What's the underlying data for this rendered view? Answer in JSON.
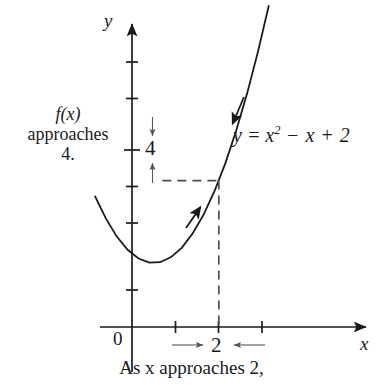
{
  "figure": {
    "title_caption": "As x approaches 2,",
    "background_color": "#ffffff",
    "ink_color": "#1a1a1a",
    "dash_color": "#6a6a6a"
  },
  "axes": {
    "y_label": "y",
    "x_label": "x",
    "origin_label": "0",
    "y_value_label": "4",
    "x_value_label": "2"
  },
  "annotations": {
    "left_line1": "f(x)",
    "left_line2": "approaches",
    "left_line3": "4.",
    "equation_lhs": "y = x",
    "equation_exp": "2",
    "equation_rhs": " − x + 2"
  },
  "chart_data": {
    "type": "line",
    "title": "",
    "subtitle": "",
    "xlabel": "x",
    "ylabel": "y",
    "function": "y = x^2 - x + 2",
    "xlim": [
      -0.9,
      5.5
    ],
    "ylim": [
      -0.6,
      8.6
    ],
    "grid": false,
    "legend": "none",
    "x_ticks": [
      1,
      2,
      3
    ],
    "y_ticks": [
      1,
      2,
      3,
      4,
      5,
      6,
      7,
      8
    ],
    "x_tick_labels": [
      "",
      "2",
      ""
    ],
    "y_tick_labels": [
      "",
      "",
      "",
      "4",
      "",
      "",
      "",
      ""
    ],
    "vertex": [
      0.5,
      1.75
    ],
    "limit_point": [
      2,
      4
    ],
    "guide_lines": [
      {
        "type": "horizontal",
        "value": 4,
        "from_x": 0.7,
        "to_x": 2,
        "style": "dashed"
      },
      {
        "type": "vertical",
        "value": 2,
        "from_y": 0,
        "to_y": 4,
        "style": "dashed"
      }
    ],
    "series": [
      {
        "name": "y = x^2 - x + 2",
        "x": [
          -0.85,
          -0.6,
          -0.35,
          -0.1,
          0.15,
          0.4,
          0.65,
          0.9,
          1.15,
          1.4,
          1.65,
          1.9,
          2.15,
          2.4,
          2.65,
          2.9,
          3.15
        ],
        "values": [
          3.57,
          2.96,
          2.47,
          2.11,
          1.87,
          1.76,
          1.77,
          1.91,
          2.17,
          2.56,
          3.07,
          3.71,
          4.47,
          5.36,
          6.37,
          7.51,
          8.77
        ]
      }
    ],
    "annotations": [
      {
        "text": "f(x) approaches 4.",
        "position": "left-of-y-axis"
      },
      {
        "text": "As x approaches 2,",
        "position": "below-x-axis"
      },
      {
        "text": "y = x^2 - x + 2",
        "position": "right-of-curve"
      }
    ],
    "approach_arrows": {
      "y_down": {
        "from": 5.2,
        "to": 4.4
      },
      "y_up": {
        "from": 2.6,
        "to": 3.6
      },
      "x_right": {
        "from": 1.1,
        "to": 1.75
      },
      "x_left": {
        "from": 2.85,
        "to": 2.25
      }
    }
  }
}
